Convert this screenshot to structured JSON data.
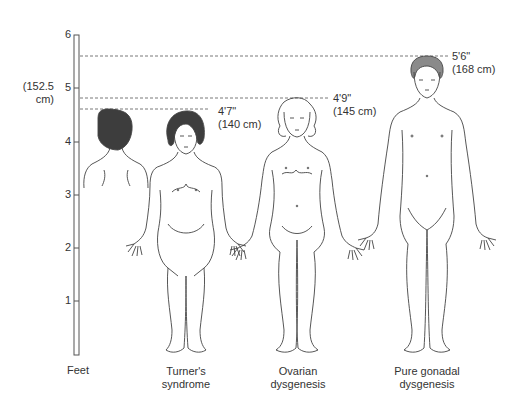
{
  "scale": {
    "unit_label": "Feet",
    "ticks": [
      "6",
      "5",
      "4",
      "3",
      "2",
      "1"
    ],
    "cm_note_line1": "(152.5",
    "cm_note_line2": "cm)"
  },
  "heights": [
    {
      "imperial": "5'6\"",
      "metric": "(168 cm)"
    },
    {
      "imperial": "4'9\"",
      "metric": "(145 cm)"
    },
    {
      "imperial": "4'7\"",
      "metric": "(140 cm)"
    }
  ],
  "figures": [
    {
      "caption_line1": "Turner's",
      "caption_line2": "syndrome"
    },
    {
      "caption_line1": "Ovarian",
      "caption_line2": "dysgenesis"
    },
    {
      "caption_line1": "Pure gonadal",
      "caption_line2": "dysgenesis"
    }
  ],
  "colors": {
    "line": "#4a4a4a",
    "dark_hair": "#3d3d3d",
    "gray_hair": "#8a8a8a"
  }
}
